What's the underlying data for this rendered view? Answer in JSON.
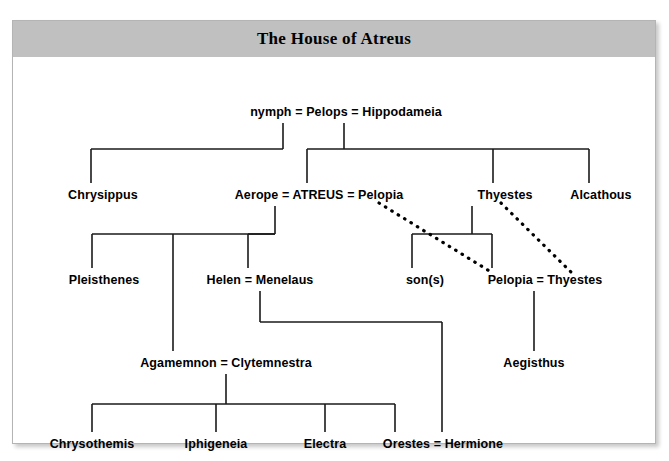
{
  "page": {
    "title": "The House of Atreus",
    "background_color": "#ffffff",
    "panel_border_color": "#b4b4b4",
    "title_bar_color": "#c0c0c0",
    "line_color": "#1a1a1a",
    "text_color": "#000000"
  },
  "diagram": {
    "type": "family-tree",
    "subject": "The House of Atreus",
    "generations": [
      {
        "level": 1,
        "nodes": [
          {
            "id": "pelops-union",
            "label": "nymph = Pelops = Hippodameia",
            "x": 333,
            "y": 56
          }
        ]
      },
      {
        "level": 2,
        "nodes": [
          {
            "id": "chrysippus",
            "label": "Chrysippus",
            "x": 90,
            "y": 139
          },
          {
            "id": "atreus-union",
            "label": "Aerope = ATREUS = Pelopia",
            "x": 306,
            "y": 139
          },
          {
            "id": "thyestes",
            "label": "Thyestes",
            "x": 492,
            "y": 139
          },
          {
            "id": "alcathous",
            "label": "Alcathous",
            "x": 588,
            "y": 139
          }
        ]
      },
      {
        "level": 3,
        "nodes": [
          {
            "id": "pleisthenes",
            "label": "Pleisthenes",
            "x": 91,
            "y": 224
          },
          {
            "id": "helen-union",
            "label": "Helen = Menelaus",
            "x": 247,
            "y": 224
          },
          {
            "id": "sons",
            "label": "son(s)",
            "x": 412,
            "y": 224
          },
          {
            "id": "pelopia-union",
            "label": "Pelopia = Thyestes",
            "x": 532,
            "y": 224
          }
        ]
      },
      {
        "level": 4,
        "nodes": [
          {
            "id": "agamemnon-union",
            "label": "Agamemnon = Clytemnestra",
            "x": 213,
            "y": 307
          },
          {
            "id": "aegisthus",
            "label": "Aegisthus",
            "x": 521,
            "y": 307
          }
        ]
      },
      {
        "level": 5,
        "nodes": [
          {
            "id": "chrysothemis",
            "label": "Chrysothemis",
            "x": 79,
            "y": 388
          },
          {
            "id": "iphigeneia",
            "label": "Iphigeneia",
            "x": 203,
            "y": 388
          },
          {
            "id": "electra",
            "label": "Electra",
            "x": 312,
            "y": 388
          },
          {
            "id": "orestes-union",
            "label": "Orestes = Hermione",
            "x": 430,
            "y": 388
          }
        ]
      }
    ],
    "identity_links": [
      {
        "id": "pelopia-identity",
        "from": "Pelopia",
        "to": "Pelopia",
        "style": "dotted"
      },
      {
        "id": "thyestes-identity",
        "from": "Thyestes",
        "to": "Thyestes",
        "style": "dotted"
      }
    ]
  }
}
